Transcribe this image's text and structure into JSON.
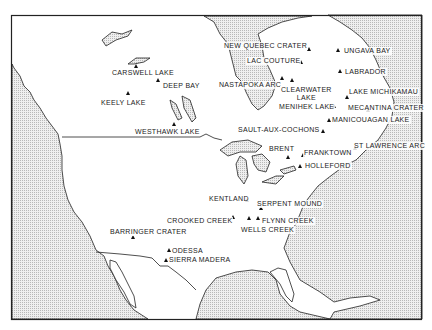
{
  "map": {
    "title": "Impact craters of North America",
    "colors": {
      "ocean_pattern": "#d8d8d8",
      "land": "#ffffff",
      "line": "#222222",
      "marker": "#111111"
    },
    "craters": [
      {
        "id": "new-quebec-crater",
        "label": "NEW QUEBEC CRATER",
        "marker": [
          309,
          49
        ],
        "text": [
          223,
          42
        ]
      },
      {
        "id": "ungava-bay",
        "label": "UNGAVA BAY",
        "marker": [
          338,
          50
        ],
        "text": [
          343,
          47
        ]
      },
      {
        "id": "lac-couture",
        "label": "LAC COUTURE",
        "marker": [
          301,
          62
        ],
        "text": [
          246,
          57
        ]
      },
      {
        "id": "labrador",
        "label": "LABRADOR",
        "marker": [
          340,
          71
        ],
        "text": [
          344,
          68
        ]
      },
      {
        "id": "nastapoka-arc",
        "label": "NASTAPOKA ARC",
        "marker": [
          282,
          78
        ],
        "text": [
          218,
          81
        ]
      },
      {
        "id": "clearwater-lake",
        "label": "CLEARWATER\nLAKE",
        "marker": [
          292,
          80
        ],
        "text": [
          280,
          86
        ]
      },
      {
        "id": "menihek-lake",
        "label": "MENIHEK LAKE",
        "marker": [
          334,
          106
        ],
        "text": [
          278,
          103
        ]
      },
      {
        "id": "lake-michikamau",
        "label": "LAKE MICHIKAMAU",
        "marker": [
          347,
          97
        ],
        "text": [
          348,
          88
        ]
      },
      {
        "id": "mecantina-crater",
        "label": "MECANTINA CRATER",
        "marker": [
          368,
          110
        ],
        "text": [
          347,
          104
        ]
      },
      {
        "id": "manicouagan-lake",
        "label": "MANICOUAGAN LAKE",
        "marker": [
          329,
          120
        ],
        "text": [
          331,
          116
        ]
      },
      {
        "id": "sault-aux-cochons",
        "label": "SAULT-AUX-COCHONS",
        "marker": [
          323,
          131
        ],
        "text": [
          237,
          126
        ]
      },
      {
        "id": "st-lawrence-arc",
        "label": "ST LAWRENCE ARC",
        "marker": [
          355,
          148
        ],
        "text": [
          353,
          142
        ]
      },
      {
        "id": "brent",
        "label": "BRENT",
        "marker": [
          288,
          157
        ],
        "text": [
          268,
          145
        ]
      },
      {
        "id": "franktown",
        "label": "FRANKTOWN",
        "marker": [
          303,
          155
        ],
        "text": [
          303,
          149
        ]
      },
      {
        "id": "holleford",
        "label": "HOLLEFORD",
        "marker": [
          300,
          166
        ],
        "text": [
          304,
          162
        ]
      },
      {
        "id": "keely-lake",
        "label": "KEELY LAKE",
        "marker": [
          128,
          93
        ],
        "text": [
          100,
          99
        ]
      },
      {
        "id": "carswell-lake",
        "label": "CARSWELL LAKE",
        "marker": [
          136,
          66
        ],
        "text": [
          111,
          69
        ]
      },
      {
        "id": "deep-bay",
        "label": "DEEP BAY",
        "marker": [
          158,
          80
        ],
        "text": [
          162,
          82
        ]
      },
      {
        "id": "westhawk-lake",
        "label": "WESTHAWK LAKE",
        "marker": [
          174,
          124
        ],
        "text": [
          134,
          128
        ]
      },
      {
        "id": "kentland",
        "label": "KENTLAND",
        "marker": [
          247,
          200
        ],
        "text": [
          208,
          195
        ]
      },
      {
        "id": "serpent-mound",
        "label": "SERPENT MOUND",
        "marker": [
          261,
          208
        ],
        "text": [
          256,
          200
        ]
      },
      {
        "id": "crooked-creek",
        "label": "CROOKED CREEK",
        "marker": [
          233,
          217
        ],
        "text": [
          166,
          217
        ]
      },
      {
        "id": "wells-creek",
        "label": "WELLS CREEK",
        "marker": [
          249,
          218
        ],
        "text": [
          240,
          226
        ]
      },
      {
        "id": "flynn-creek",
        "label": "FLYNN CREEK",
        "marker": [
          258,
          218
        ],
        "text": [
          261,
          217
        ]
      },
      {
        "id": "barringer-crater",
        "label": "BARRINGER CRATER",
        "marker": [
          133,
          237
        ],
        "text": [
          109,
          228
        ]
      },
      {
        "id": "odessa",
        "label": "ODESSA",
        "marker": [
          169,
          250
        ],
        "text": [
          171,
          247
        ]
      },
      {
        "id": "sierra-madera",
        "label": "SIERRA MADERA",
        "marker": [
          166,
          260
        ],
        "text": [
          168,
          256
        ]
      }
    ]
  }
}
